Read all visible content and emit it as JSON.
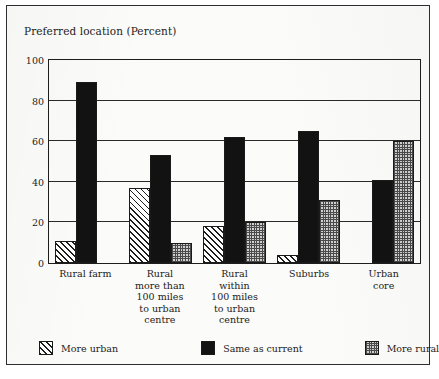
{
  "chart_data": {
    "type": "bar",
    "title": "Preferred location (Percent)",
    "xlabel": "",
    "ylabel": "",
    "ylim": [
      0,
      100
    ],
    "yticks": [
      0,
      20,
      40,
      60,
      80,
      100
    ],
    "grid": true,
    "legend_position": "bottom",
    "categories": [
      "Rural farm",
      "Rural more than 100 miles to urban centre",
      "Rural within 100 miles to urban centre",
      "Suburbs",
      "Urban core"
    ],
    "category_lines": [
      [
        "Rural farm"
      ],
      [
        "Rural",
        "more than",
        "100 miles",
        "to urban",
        "centre"
      ],
      [
        "Rural",
        "within",
        "100 miles",
        "to urban",
        "centre"
      ],
      [
        "Suburbs"
      ],
      [
        "Urban",
        "core"
      ]
    ],
    "series": [
      {
        "name": "More urban",
        "pattern": "diagonal-hatch",
        "color": "#ffffff",
        "values": [
          11,
          37,
          18,
          4,
          0
        ]
      },
      {
        "name": "Same as current",
        "pattern": "solid-black",
        "color": "#121212",
        "values": [
          89,
          53,
          62,
          65,
          41
        ]
      },
      {
        "name": "More rural",
        "pattern": "checker-dots",
        "color": "#cfcfcf",
        "values": [
          0,
          10,
          20,
          31,
          60
        ]
      }
    ]
  },
  "legend": {
    "items": [
      {
        "label": "More urban"
      },
      {
        "label": "Same as current"
      },
      {
        "label": "More rural"
      }
    ]
  }
}
